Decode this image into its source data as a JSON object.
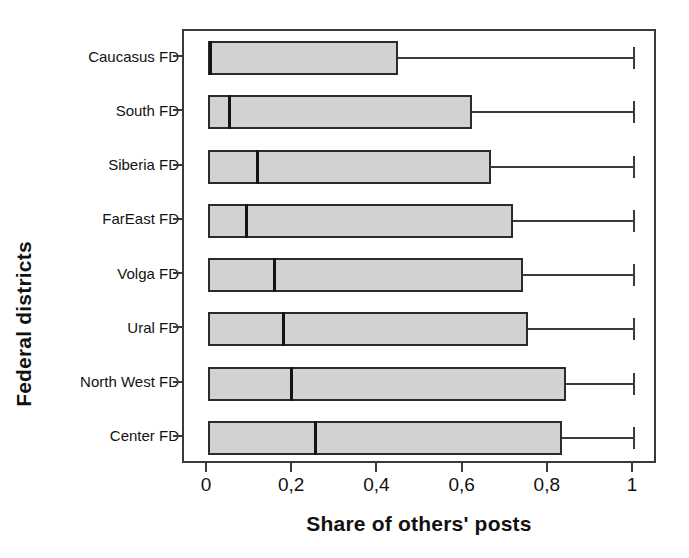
{
  "chart_data": {
    "type": "bar",
    "subtype": "horizontal-boxplot",
    "title": "",
    "xlabel": "Share of others' posts",
    "ylabel": "Federal districts",
    "xlim": [
      0,
      1
    ],
    "grid": false,
    "legend": false,
    "decimal_separator": ",",
    "x_ticks": [
      {
        "value": 0,
        "label": "0"
      },
      {
        "value": 0.2,
        "label": "0,2"
      },
      {
        "value": 0.4,
        "label": "0,4"
      },
      {
        "value": 0.6,
        "label": "0,6"
      },
      {
        "value": 0.8,
        "label": "0,8"
      },
      {
        "value": 1,
        "label": "1"
      }
    ],
    "categories": [
      "Caucasus FD",
      "South FD",
      "Siberia FD",
      "FarEast FD",
      "Volga FD",
      "Ural FD",
      "North West FD",
      "Center FD"
    ],
    "boxes": [
      {
        "category": "Caucasus FD",
        "whisker_low": 0.0,
        "q1": 0.0,
        "median": 0.005,
        "q3": 0.445,
        "whisker_high": 1.0
      },
      {
        "category": "South FD",
        "whisker_low": 0.0,
        "q1": 0.0,
        "median": 0.05,
        "q3": 0.62,
        "whisker_high": 1.0
      },
      {
        "category": "Siberia FD",
        "whisker_low": 0.0,
        "q1": 0.0,
        "median": 0.115,
        "q3": 0.665,
        "whisker_high": 1.0
      },
      {
        "category": "FarEast FD",
        "whisker_low": 0.0,
        "q1": 0.0,
        "median": 0.09,
        "q3": 0.715,
        "whisker_high": 1.0
      },
      {
        "category": "Volga FD",
        "whisker_low": 0.0,
        "q1": 0.0,
        "median": 0.155,
        "q3": 0.74,
        "whisker_high": 1.0
      },
      {
        "category": "Ural FD",
        "whisker_low": 0.0,
        "q1": 0.0,
        "median": 0.175,
        "q3": 0.75,
        "whisker_high": 1.0
      },
      {
        "category": "North West FD",
        "whisker_low": 0.0,
        "q1": 0.0,
        "median": 0.195,
        "q3": 0.84,
        "whisker_high": 1.0
      },
      {
        "category": "Center FD",
        "whisker_low": 0.0,
        "q1": 0.0,
        "median": 0.25,
        "q3": 0.83,
        "whisker_high": 1.0
      }
    ],
    "colors": {
      "box_fill": "#d2d2d2",
      "box_border": "#2b2b2b",
      "median": "#141414",
      "whisker": "#3a3a3a",
      "frame": "#3a3a3a",
      "text": "#121212",
      "background": "#ffffff"
    }
  },
  "axis": {
    "x_title": "Share of others' posts",
    "y_title": "Federal districts"
  }
}
